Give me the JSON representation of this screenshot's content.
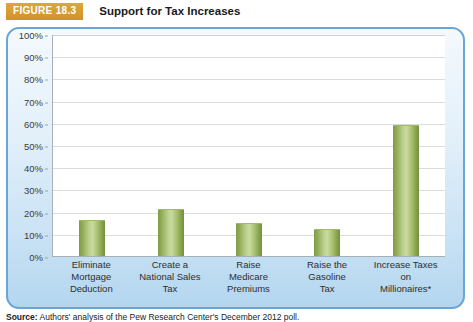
{
  "figure": {
    "badge_label": "FIGURE 18.3",
    "title": "Support for Tax Increases"
  },
  "source_note": {
    "prefix": "Source:",
    "text": " Authors' analysis of the Pew Research Center's December 2012 poll."
  },
  "chart_data": {
    "type": "bar",
    "title": "Support for Tax Increases",
    "categories": [
      "Eliminate Mortgage Deduction",
      "Create a National Sales Tax",
      "Raise Medicare Premiums",
      "Raise the Gasoline Tax",
      "Increase Taxes on Millionaires*"
    ],
    "category_lines": [
      [
        "Eliminate",
        "Mortgage",
        "Deduction"
      ],
      [
        "Create a",
        "National Sales",
        "Tax"
      ],
      [
        "Raise",
        "Medicare",
        "Premiums"
      ],
      [
        "Raise the",
        "Gasoline",
        "Tax"
      ],
      [
        "Increase Taxes",
        "on",
        "Millionaires*"
      ]
    ],
    "values": [
      16,
      21,
      15,
      12,
      59
    ],
    "xlabel": "",
    "ylabel": "",
    "ylim": [
      0,
      100
    ],
    "ytick_labels": [
      "100%",
      "90%",
      "80%",
      "70%",
      "60%",
      "50%",
      "40%",
      "30%",
      "20%",
      "10%",
      "0%"
    ],
    "ytick_values": [
      100,
      90,
      80,
      70,
      60,
      50,
      40,
      30,
      20,
      10,
      0
    ],
    "grid": true,
    "legend": "none",
    "bar_color": "#a7bf6d",
    "panel_border_color": "#6aa5d4",
    "badge_color": "#d99b2e"
  }
}
